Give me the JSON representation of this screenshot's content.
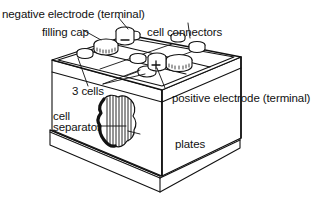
{
  "diagram": {
    "labels": {
      "negative_electrode": "negative electrode (terminal)",
      "filling_cap": "filling cap",
      "cell_connectors": "cell connectors",
      "three_cells": "3 cells",
      "positive_electrode": "positive electrode (terminal)",
      "cell": "cell",
      "separator": "separator",
      "plates": "plates"
    },
    "symbols": {
      "negative": "−",
      "positive": "+"
    },
    "colors": {
      "line": "#111111",
      "background": "#ffffff"
    }
  }
}
